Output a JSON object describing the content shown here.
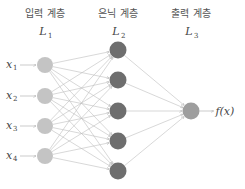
{
  "layers": [
    {
      "title": "입력 계층",
      "name": "L",
      "sub": "1",
      "x": 45
    },
    {
      "title": "은닉 계층",
      "name": "L",
      "sub": "2",
      "x": 118
    },
    {
      "title": "출력 계층",
      "name": "L",
      "sub": "3",
      "x": 191
    }
  ],
  "inputs": [
    {
      "label": "x",
      "sub": "1",
      "y": 65
    },
    {
      "label": "x",
      "sub": "2",
      "y": 96
    },
    {
      "label": "x",
      "sub": "3",
      "y": 126
    },
    {
      "label": "x",
      "sub": "4",
      "y": 156
    }
  ],
  "hidden": [
    50,
    80,
    111,
    141,
    171
  ],
  "output": {
    "y": 111,
    "label": "f(x)"
  },
  "colors": {
    "input_node": "#c4c4c4",
    "hidden_node": "#6e6e6e",
    "output_node": "#9e9e9e",
    "edge": "#bdbdbd"
  }
}
